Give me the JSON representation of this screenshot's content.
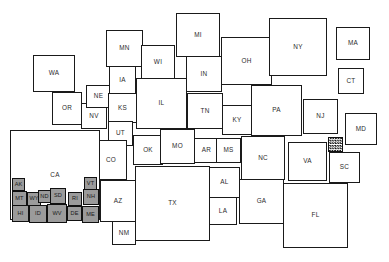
{
  "chart_data": {
    "type": "cartogram",
    "title": "",
    "subtitle": "",
    "xlabel": "",
    "ylabel": "",
    "grid": false,
    "legend": "none",
    "canvas": {
      "width": 389,
      "height": 262
    },
    "fills": {
      "large_state": "#ffffff",
      "small_state": "#9b9b9b",
      "hatched_state": "#111111",
      "outline": "#1a1a1a",
      "background": "#ffffff"
    },
    "categories": [
      "WA",
      "OR",
      "NV",
      "NE",
      "IA",
      "KS",
      "UT",
      "MN",
      "WI",
      "MI",
      "IL",
      "IN",
      "OH",
      "NY",
      "MA",
      "CT",
      "TN",
      "KY",
      "PA",
      "NJ",
      "MD",
      "CO",
      "OK",
      "MO",
      "AR",
      "MS",
      "NC",
      "VA",
      "SC",
      "DC",
      "CA",
      "AZ",
      "NM",
      "TX",
      "AL",
      "LA",
      "GA",
      "FL",
      "AK",
      "MT",
      "WY",
      "ND",
      "SD",
      "HI",
      "ID",
      "WV",
      "RI",
      "DE",
      "ME",
      "VT",
      "NH"
    ],
    "rects": [
      {
        "label": "WA",
        "x": 33,
        "y": 55,
        "w": 42,
        "h": 37,
        "size": "large",
        "fill": "#ffffff"
      },
      {
        "label": "OR",
        "x": 52,
        "y": 92,
        "w": 30,
        "h": 33,
        "size": "large",
        "fill": "#ffffff"
      },
      {
        "label": "NV",
        "x": 81,
        "y": 103,
        "w": 26,
        "h": 26,
        "size": "large",
        "fill": "#ffffff"
      },
      {
        "label": "NE",
        "x": 86,
        "y": 85,
        "w": 25,
        "h": 23,
        "size": "large",
        "fill": "#ffffff"
      },
      {
        "label": "IA",
        "x": 109,
        "y": 66,
        "w": 27,
        "h": 29,
        "size": "large",
        "fill": "#ffffff"
      },
      {
        "label": "KS",
        "x": 108,
        "y": 93,
        "w": 29,
        "h": 30,
        "size": "large",
        "fill": "#ffffff"
      },
      {
        "label": "UT",
        "x": 108,
        "y": 121,
        "w": 25,
        "h": 25,
        "size": "large",
        "fill": "#ffffff"
      },
      {
        "label": "MN",
        "x": 106,
        "y": 30,
        "w": 37,
        "h": 37,
        "size": "large",
        "fill": "#ffffff"
      },
      {
        "label": "WI",
        "x": 141,
        "y": 45,
        "w": 34,
        "h": 34,
        "size": "large",
        "fill": "#ffffff"
      },
      {
        "label": "MI",
        "x": 176,
        "y": 13,
        "w": 44,
        "h": 44,
        "size": "large",
        "fill": "#ffffff"
      },
      {
        "label": "IL",
        "x": 136,
        "y": 78,
        "w": 51,
        "h": 51,
        "size": "large",
        "fill": "#ffffff"
      },
      {
        "label": "IN",
        "x": 186,
        "y": 56,
        "w": 36,
        "h": 36,
        "size": "large",
        "fill": "#ffffff"
      },
      {
        "label": "OH",
        "x": 221,
        "y": 37,
        "w": 51,
        "h": 48,
        "size": "large",
        "fill": "#ffffff"
      },
      {
        "label": "NY",
        "x": 269,
        "y": 18,
        "w": 58,
        "h": 58,
        "size": "large",
        "fill": "#ffffff"
      },
      {
        "label": "MA",
        "x": 336,
        "y": 27,
        "w": 34,
        "h": 33,
        "size": "large",
        "fill": "#ffffff"
      },
      {
        "label": "CT",
        "x": 338,
        "y": 68,
        "w": 26,
        "h": 26,
        "size": "large",
        "fill": "#ffffff"
      },
      {
        "label": "TN",
        "x": 187,
        "y": 93,
        "w": 36,
        "h": 36,
        "size": "large",
        "fill": "#ffffff"
      },
      {
        "label": "KY",
        "x": 222,
        "y": 105,
        "w": 30,
        "h": 30,
        "size": "large",
        "fill": "#ffffff"
      },
      {
        "label": "PA",
        "x": 251,
        "y": 85,
        "w": 51,
        "h": 51,
        "size": "large",
        "fill": "#ffffff"
      },
      {
        "label": "NJ",
        "x": 303,
        "y": 99,
        "w": 35,
        "h": 35,
        "size": "large",
        "fill": "#ffffff"
      },
      {
        "label": "MD",
        "x": 345,
        "y": 113,
        "w": 32,
        "h": 32,
        "size": "large",
        "fill": "#ffffff"
      },
      {
        "label": "CO",
        "x": 95,
        "y": 140,
        "w": 32,
        "h": 40,
        "size": "large",
        "fill": "#ffffff"
      },
      {
        "label": "OK",
        "x": 133,
        "y": 135,
        "w": 30,
        "h": 30,
        "size": "large",
        "fill": "#ffffff"
      },
      {
        "label": "MO",
        "x": 160,
        "y": 129,
        "w": 35,
        "h": 35,
        "size": "large",
        "fill": "#ffffff"
      },
      {
        "label": "AR",
        "x": 194,
        "y": 138,
        "w": 25,
        "h": 25,
        "size": "large",
        "fill": "#ffffff"
      },
      {
        "label": "MS",
        "x": 216,
        "y": 138,
        "w": 25,
        "h": 25,
        "size": "large",
        "fill": "#ffffff"
      },
      {
        "label": "NC",
        "x": 241,
        "y": 136,
        "w": 44,
        "h": 44,
        "size": "large",
        "fill": "#ffffff"
      },
      {
        "label": "VA",
        "x": 288,
        "y": 142,
        "w": 39,
        "h": 39,
        "size": "large",
        "fill": "#ffffff"
      },
      {
        "label": "SC",
        "x": 329,
        "y": 152,
        "w": 31,
        "h": 31,
        "size": "large",
        "fill": "#ffffff"
      },
      {
        "label": "DC",
        "x": 328,
        "y": 137,
        "w": 15,
        "h": 15,
        "size": "hatched",
        "fill": "#111111"
      },
      {
        "label": "CA",
        "x": 10,
        "y": 130,
        "w": 90,
        "h": 90,
        "size": "large",
        "fill": "#ffffff"
      },
      {
        "label": "AZ",
        "x": 100,
        "y": 180,
        "w": 36,
        "h": 42,
        "size": "large",
        "fill": "#ffffff"
      },
      {
        "label": "NM",
        "x": 112,
        "y": 221,
        "w": 24,
        "h": 24,
        "size": "large",
        "fill": "#ffffff"
      },
      {
        "label": "TX",
        "x": 135,
        "y": 166,
        "w": 75,
        "h": 75,
        "size": "large",
        "fill": "#ffffff"
      },
      {
        "label": "AL",
        "x": 209,
        "y": 167,
        "w": 31,
        "h": 31,
        "size": "large",
        "fill": "#ffffff"
      },
      {
        "label": "LA",
        "x": 209,
        "y": 197,
        "w": 28,
        "h": 28,
        "size": "large",
        "fill": "#ffffff"
      },
      {
        "label": "GA",
        "x": 239,
        "y": 179,
        "w": 45,
        "h": 45,
        "size": "large",
        "fill": "#ffffff"
      },
      {
        "label": "FL",
        "x": 283,
        "y": 183,
        "w": 65,
        "h": 65,
        "size": "large",
        "fill": "#ffffff"
      },
      {
        "label": "AK",
        "x": 12,
        "y": 178,
        "w": 13,
        "h": 13,
        "size": "small",
        "fill": "#9b9b9b"
      },
      {
        "label": "MT",
        "x": 12,
        "y": 191,
        "w": 15,
        "h": 15,
        "size": "small",
        "fill": "#9b9b9b"
      },
      {
        "label": "WY",
        "x": 27,
        "y": 192,
        "w": 14,
        "h": 14,
        "size": "small",
        "fill": "#9b9b9b"
      },
      {
        "label": "ND",
        "x": 38,
        "y": 190,
        "w": 13,
        "h": 13,
        "size": "small",
        "fill": "#9b9b9b"
      },
      {
        "label": "SD",
        "x": 50,
        "y": 188,
        "w": 16,
        "h": 16,
        "size": "small",
        "fill": "#9b9b9b"
      },
      {
        "label": "HI",
        "x": 12,
        "y": 205,
        "w": 17,
        "h": 17,
        "size": "small",
        "fill": "#9b9b9b"
      },
      {
        "label": "ID",
        "x": 29,
        "y": 205,
        "w": 18,
        "h": 18,
        "size": "small",
        "fill": "#9b9b9b"
      },
      {
        "label": "WV",
        "x": 47,
        "y": 204,
        "w": 20,
        "h": 19,
        "size": "small",
        "fill": "#9b9b9b"
      },
      {
        "label": "RI",
        "x": 68,
        "y": 192,
        "w": 14,
        "h": 14,
        "size": "small",
        "fill": "#9b9b9b"
      },
      {
        "label": "DE",
        "x": 67,
        "y": 206,
        "w": 15,
        "h": 15,
        "size": "small",
        "fill": "#9b9b9b"
      },
      {
        "label": "ME",
        "x": 82,
        "y": 206,
        "w": 17,
        "h": 17,
        "size": "small",
        "fill": "#9b9b9b"
      },
      {
        "label": "VT",
        "x": 84,
        "y": 177,
        "w": 13,
        "h": 13,
        "size": "small",
        "fill": "#9b9b9b"
      },
      {
        "label": "NH",
        "x": 83,
        "y": 189,
        "w": 16,
        "h": 16,
        "size": "small",
        "fill": "#9b9b9b"
      }
    ]
  }
}
